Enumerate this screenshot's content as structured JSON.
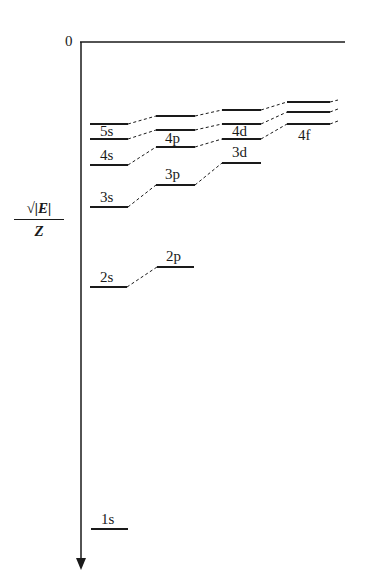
{
  "diagram": {
    "type": "energy-level-diagram",
    "y_axis": {
      "label_numerator": "√|E|",
      "label_denominator": "Z",
      "zero_label": "0",
      "direction": "downward"
    },
    "columns": [
      {
        "name": "s",
        "x_start": 90,
        "x_end": 128
      },
      {
        "name": "p",
        "x_start": 156,
        "x_end": 195
      },
      {
        "name": "d",
        "x_start": 222,
        "x_end": 261
      },
      {
        "name": "f",
        "x_start": 287,
        "x_end": 330
      }
    ],
    "levels": [
      {
        "label": "1s",
        "column": "s",
        "y": 529,
        "show_label": true
      },
      {
        "label": "2s",
        "column": "s",
        "y": 287,
        "show_label": true
      },
      {
        "label": "2p",
        "column": "p",
        "y": 267,
        "show_label": true
      },
      {
        "label": "3s",
        "column": "s",
        "y": 207,
        "show_label": true
      },
      {
        "label": "3p",
        "column": "p",
        "y": 185,
        "show_label": true
      },
      {
        "label": "3d",
        "column": "d",
        "y": 163,
        "show_label": true
      },
      {
        "label": "4s",
        "column": "s",
        "y": 165,
        "show_label": true
      },
      {
        "label": "4p",
        "column": "p",
        "y": 147,
        "show_label": true
      },
      {
        "label": "4d",
        "column": "d",
        "y": 139,
        "show_label": true
      },
      {
        "label": "4f",
        "column": "f",
        "y": 124,
        "show_label": true
      },
      {
        "label": "5s",
        "column": "s",
        "y": 139,
        "show_label": true
      },
      {
        "label": "5p",
        "column": "p",
        "y": 130,
        "show_label": false
      },
      {
        "label": "5d",
        "column": "d",
        "y": 124,
        "show_label": false
      },
      {
        "label": "5f",
        "column": "f",
        "y": 112,
        "show_label": false
      },
      {
        "label": "6s",
        "column": "s",
        "y": 124,
        "show_label": false
      },
      {
        "label": "6p",
        "column": "p",
        "y": 116,
        "show_label": false
      },
      {
        "label": "6d",
        "column": "d",
        "y": 110,
        "show_label": false
      },
      {
        "label": "6f",
        "column": "f",
        "y": 102,
        "show_label": false
      }
    ],
    "labels": {
      "l1s": "1s",
      "l2s": "2s",
      "l2p": "2p",
      "l3s": "3s",
      "l3p": "3p",
      "l3d": "3d",
      "l4s": "4s",
      "l4p": "4p",
      "l4d": "4d",
      "l4f": "4f",
      "l5s": "5s"
    }
  }
}
